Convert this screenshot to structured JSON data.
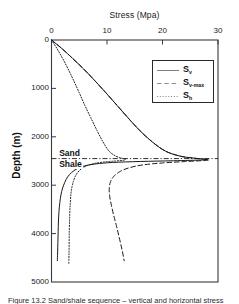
{
  "figure": {
    "caption": "Figure 13.2  Sand/shale sequence – vertical and horizontal stress"
  },
  "chart_data": {
    "type": "line",
    "title": "Stress (Mpa)",
    "xlabel": "Stress (Mpa)",
    "ylabel": "Depth (m)",
    "x_axis_position": "top",
    "y_axis_inverted": true,
    "xlim": [
      0,
      30
    ],
    "ylim": [
      0,
      5000
    ],
    "xticks": [
      0,
      10,
      20,
      30
    ],
    "yticks": [
      0,
      1000,
      2000,
      3000,
      4000,
      5000
    ],
    "xtick_labels": [
      "0",
      "10",
      "20",
      "30"
    ],
    "ytick_labels": [
      "0",
      "1000",
      "2000",
      "3000",
      "4000",
      "5000"
    ],
    "grid": false,
    "legend_position": "upper right",
    "annotations": [
      {
        "name": "sand-label",
        "text": "Sand",
        "x": 1.2,
        "y": 2330
      },
      {
        "name": "shale-label",
        "text": "Shale",
        "x": 1.2,
        "y": 2560
      },
      {
        "name": "sand-shale-boundary",
        "text": "",
        "type": "hline",
        "y": 2450,
        "style": "dashdot"
      }
    ],
    "series": [
      {
        "name": "S_v",
        "label": "S",
        "sublabel": "v",
        "style": "solid",
        "color": "#1a1a1a",
        "points": [
          [
            0.0,
            0
          ],
          [
            1.9,
            180
          ],
          [
            3.8,
            380
          ],
          [
            5.8,
            600
          ],
          [
            7.8,
            840
          ],
          [
            9.8,
            1090
          ],
          [
            11.8,
            1350
          ],
          [
            13.8,
            1610
          ],
          [
            15.9,
            1870
          ],
          [
            18.2,
            2110
          ],
          [
            20.6,
            2300
          ],
          [
            23.2,
            2400
          ],
          [
            25.6,
            2440
          ],
          [
            27.4,
            2460
          ],
          [
            28.2,
            2470
          ],
          [
            27.0,
            2480
          ],
          [
            22.0,
            2495
          ],
          [
            16.0,
            2510
          ],
          [
            11.0,
            2530
          ],
          [
            8.0,
            2560
          ],
          [
            6.0,
            2600
          ],
          [
            4.6,
            2660
          ],
          [
            3.6,
            2740
          ],
          [
            2.9,
            2830
          ],
          [
            2.4,
            2940
          ],
          [
            2.0,
            3060
          ],
          [
            1.7,
            3200
          ],
          [
            1.5,
            3360
          ],
          [
            1.35,
            3540
          ],
          [
            1.25,
            3740
          ],
          [
            1.2,
            3960
          ],
          [
            1.15,
            4180
          ],
          [
            1.1,
            4400
          ],
          [
            1.05,
            4560
          ]
        ]
      },
      {
        "name": "S_v-max",
        "label": "S",
        "sublabel": "v-max",
        "style": "dashed",
        "color": "#1a1a1a",
        "points": [
          [
            0.0,
            0
          ],
          [
            1.9,
            180
          ],
          [
            3.8,
            380
          ],
          [
            5.8,
            600
          ],
          [
            7.8,
            840
          ],
          [
            9.8,
            1090
          ],
          [
            11.8,
            1350
          ],
          [
            13.8,
            1610
          ],
          [
            15.9,
            1870
          ],
          [
            18.2,
            2110
          ],
          [
            20.6,
            2300
          ],
          [
            23.2,
            2400
          ],
          [
            25.6,
            2440
          ],
          [
            27.4,
            2462
          ],
          [
            28.3,
            2478
          ],
          [
            27.2,
            2492
          ],
          [
            24.0,
            2512
          ],
          [
            20.0,
            2540
          ],
          [
            16.5,
            2580
          ],
          [
            14.0,
            2640
          ],
          [
            12.3,
            2720
          ],
          [
            11.2,
            2820
          ],
          [
            10.6,
            2940
          ],
          [
            10.4,
            3080
          ],
          [
            10.5,
            3240
          ],
          [
            10.8,
            3420
          ],
          [
            11.2,
            3620
          ],
          [
            11.7,
            3840
          ],
          [
            12.2,
            4080
          ],
          [
            12.7,
            4330
          ],
          [
            13.1,
            4560
          ]
        ]
      },
      {
        "name": "S_h",
        "label": "S",
        "sublabel": "h",
        "style": "dotted",
        "color": "#1a1a1a",
        "points": [
          [
            0.0,
            0
          ],
          [
            1.0,
            180
          ],
          [
            2.0,
            380
          ],
          [
            3.0,
            600
          ],
          [
            4.0,
            840
          ],
          [
            5.0,
            1090
          ],
          [
            6.0,
            1350
          ],
          [
            7.1,
            1610
          ],
          [
            8.2,
            1870
          ],
          [
            9.3,
            2110
          ],
          [
            10.4,
            2300
          ],
          [
            11.6,
            2400
          ],
          [
            12.6,
            2440
          ],
          [
            13.3,
            2465
          ],
          [
            13.0,
            2485
          ],
          [
            11.5,
            2500
          ],
          [
            9.5,
            2520
          ],
          [
            8.0,
            2545
          ],
          [
            6.8,
            2580
          ],
          [
            5.8,
            2630
          ],
          [
            5.0,
            2700
          ],
          [
            4.4,
            2790
          ],
          [
            4.0,
            2900
          ],
          [
            3.7,
            3030
          ],
          [
            3.5,
            3180
          ],
          [
            3.4,
            3350
          ],
          [
            3.3,
            3540
          ],
          [
            3.25,
            3750
          ],
          [
            3.2,
            3980
          ],
          [
            3.18,
            4220
          ],
          [
            3.15,
            4450
          ],
          [
            3.12,
            4620
          ]
        ]
      }
    ]
  }
}
